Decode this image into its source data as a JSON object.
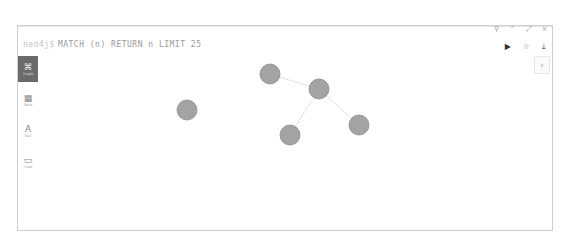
{
  "frame": {
    "window_controls": [
      {
        "name": "pin-icon",
        "glyph": "⚲"
      },
      {
        "name": "minimize-icon",
        "glyph": "⌃"
      },
      {
        "name": "expand-icon",
        "glyph": "⤢"
      },
      {
        "name": "close-icon",
        "glyph": "×"
      }
    ],
    "query": {
      "prompt": "neo4j$",
      "text": "MATCH (n) RETURN n LIMIT 25"
    },
    "actions": [
      {
        "name": "run-icon",
        "glyph": "▶"
      },
      {
        "name": "favorite-star-icon",
        "glyph": "☆"
      },
      {
        "name": "download-icon",
        "glyph": "⤓"
      }
    ],
    "collapse_glyph": "‹"
  },
  "sidebar": {
    "items": [
      {
        "name": "graph",
        "label": "Graph",
        "glyph": "⌘",
        "active": true
      },
      {
        "name": "table",
        "label": "Table",
        "glyph": "▦",
        "active": false
      },
      {
        "name": "text",
        "label": "Text",
        "glyph": "A",
        "active": false
      },
      {
        "name": "code",
        "label": "Code",
        "glyph": "▭",
        "active": false
      }
    ]
  },
  "graph": {
    "node_color": "#a3a3a3",
    "node_stroke": "#8c8c8c",
    "edge_color": "#cfcfcf",
    "nodes": [
      {
        "id": "n1",
        "x": 253,
        "y": 49,
        "label": ""
      },
      {
        "id": "n2",
        "x": 302,
        "y": 64,
        "label": ""
      },
      {
        "id": "n3",
        "x": 170,
        "y": 85,
        "label": ""
      },
      {
        "id": "n4",
        "x": 273,
        "y": 110,
        "label": ""
      },
      {
        "id": "n5",
        "x": 342,
        "y": 100,
        "label": ""
      }
    ],
    "edges": [
      {
        "from": "n1",
        "to": "n2",
        "label": ""
      },
      {
        "from": "n2",
        "to": "n4",
        "label": ""
      },
      {
        "from": "n2",
        "to": "n5",
        "label": ""
      }
    ]
  }
}
